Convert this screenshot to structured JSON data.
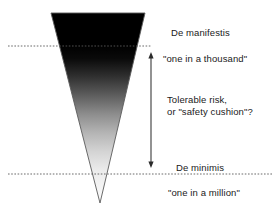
{
  "diagram": {
    "shape": {
      "name": "inverted-risk-cone",
      "top_left_x": 51,
      "top_right_x": 145,
      "top_y": 13,
      "apex_x": 100,
      "apex_y": 203,
      "gradient_from": "#000000",
      "gradient_to": "#ffffff",
      "outline_color": "#555555"
    },
    "guide_lines": [
      {
        "name": "de-manifestis-line",
        "y": 46,
        "x_start": 8,
        "x_end": 152,
        "style": "dashed",
        "color": "#5a5a5a"
      },
      {
        "name": "de-minimis-line",
        "y": 174,
        "x_start": 8,
        "x_end": 272,
        "style": "dashed",
        "color": "#5a5a5a"
      }
    ],
    "range_arrow": {
      "name": "tolerable-risk-range-arrow",
      "x": 151,
      "y_top": 53,
      "y_bottom": 167,
      "color": "#3a3a3a",
      "double_headed": true
    },
    "labels": {
      "de_manifestis": "De manifestis",
      "one_in_a_thousand": "\"one in a thousand\"",
      "tolerable_risk": "Tolerable risk,\nor \"safety cushion\"?",
      "de_minimis": "De minimis",
      "one_in_a_million": "\"one in a million\""
    }
  }
}
